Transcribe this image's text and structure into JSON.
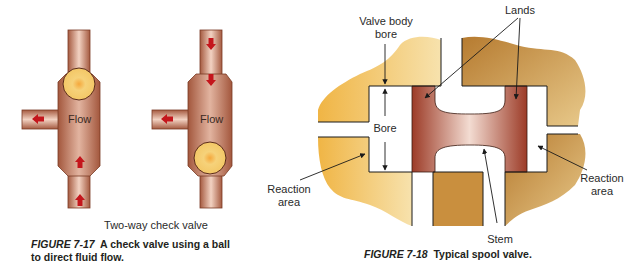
{
  "figure_7_17": {
    "sublabel": "Two-way check valve",
    "caption_figure": "FIGURE 7-17",
    "caption_text_line1": "A check valve using a ball",
    "caption_text_line2": "to direct fluid flow.",
    "valves": [
      {
        "flow_label": "Flow",
        "ball_position": "top",
        "arrow_direction": "up"
      },
      {
        "flow_label": "Flow",
        "ball_position": "bottom",
        "arrow_direction": "down"
      }
    ]
  },
  "figure_7_18": {
    "caption_figure": "FIGURE 7-18",
    "caption_text": "Typical spool valve.",
    "labels": {
      "valve_body_bore_line1": "Valve body",
      "valve_body_bore_line2": "bore",
      "lands": "Lands",
      "bore": "Bore",
      "reaction_area_left_line1": "Reaction",
      "reaction_area_left_line2": "area",
      "reaction_area_right_line1": "Reaction",
      "reaction_area_right_line2": "area",
      "stem": "Stem"
    }
  },
  "colors": {
    "pipe": "#c98a72",
    "pipe_edge": "#7a3b25",
    "ball": "#f3c766",
    "arrow": "#c4161c",
    "body_gold": "#e9b855",
    "body_brown": "#b8863f",
    "spool": "#a8452f"
  }
}
